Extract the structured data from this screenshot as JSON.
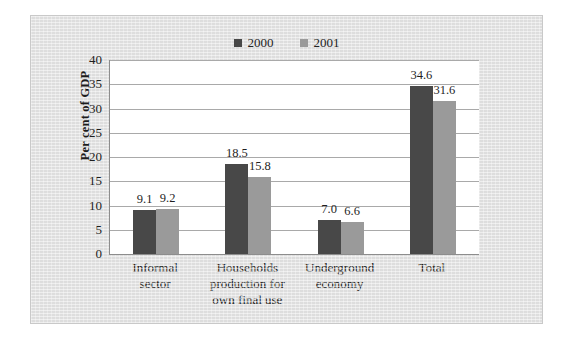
{
  "chart_data": {
    "type": "bar",
    "title": "",
    "xlabel": "",
    "ylabel": "Per cent of GDP",
    "ylim": [
      0,
      40
    ],
    "yticks": [
      40,
      35,
      30,
      25,
      20,
      15,
      10,
      5,
      0
    ],
    "grid": true,
    "legend_position": "top-center",
    "categories": [
      "Informal sector",
      "Households production for own final use",
      "Underground economy",
      "Total"
    ],
    "category_lines": [
      [
        "Informal",
        "sector"
      ],
      [
        "Households",
        "production for",
        "own final use"
      ],
      [
        "Underground",
        "economy"
      ],
      [
        "Total"
      ]
    ],
    "series": [
      {
        "name": "2000",
        "color": "#484848",
        "values": [
          9.1,
          18.5,
          7.0,
          34.6
        ],
        "labels": [
          "9.1",
          "18.5",
          "7.0",
          "34.6"
        ]
      },
      {
        "name": "2001",
        "color": "#9a9a9a",
        "values": [
          9.2,
          15.8,
          6.6,
          31.6
        ],
        "labels": [
          "9.2",
          "15.8",
          "6.6",
          "31.6"
        ]
      }
    ]
  },
  "legend": {
    "items": [
      {
        "label": "2000",
        "color": "#484848"
      },
      {
        "label": "2001",
        "color": "#9a9a9a"
      }
    ]
  },
  "axis": {
    "y_title": "Per cent of GDP",
    "y_tick_labels": [
      "40",
      "35",
      "30",
      "25",
      "20",
      "15",
      "10",
      "5",
      "0"
    ]
  }
}
